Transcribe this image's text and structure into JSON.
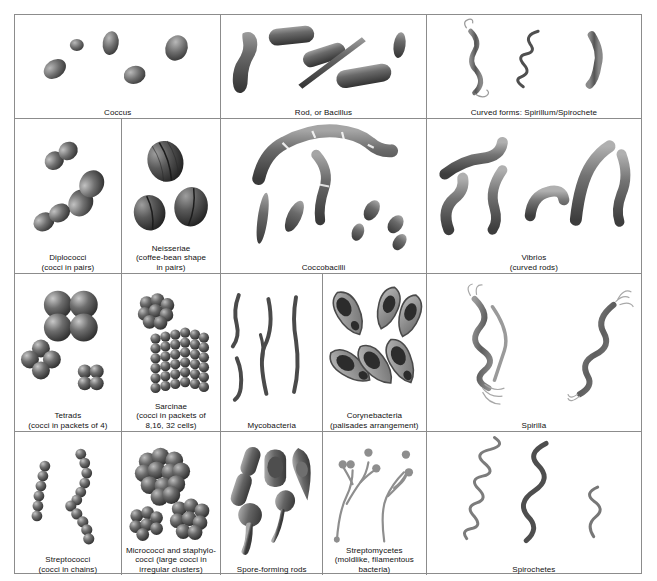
{
  "figure": {
    "kind": "bacterial-morphology-plate",
    "grid_rows": 4,
    "outer_border_color": "#8c8c8c",
    "background": "#ffffff",
    "cell_ink_color": "#4a4a4a"
  },
  "rows": [
    {
      "index": 1,
      "cells": [
        {
          "id": "coccus",
          "label": "Coccus",
          "art": "ovals-scattered",
          "count": 5
        },
        {
          "id": "rod-bacillus",
          "label": "Rod, or Bacillus",
          "art": "rods-scattered",
          "count": 6
        },
        {
          "id": "curved-forms",
          "label": "Curved forms: Spirillum/Spirochete",
          "art": "curved-mixed",
          "count": 3
        }
      ]
    },
    {
      "index": 2,
      "cells": [
        {
          "id": "diplococci",
          "label": "Diplococci\n(cocci in pairs)",
          "art": "cocci-pairs",
          "count": 3
        },
        {
          "id": "neisseriae",
          "label": "Neisseriae\n(coffee-bean shape\nin pairs)",
          "art": "coffee-beans",
          "count": 3
        },
        {
          "id": "coccobacilli",
          "label": "Coccobacilli",
          "art": "coccobacilli",
          "count": 9
        },
        {
          "id": "vibrios",
          "label": "Vibrios\n(curved rods)",
          "art": "curved-rods",
          "count": 6
        }
      ]
    },
    {
      "index": 3,
      "cells": [
        {
          "id": "tetrads",
          "label": "Tetrads\n(cocci in packets of 4)",
          "art": "tetrads",
          "count": 3
        },
        {
          "id": "sarcinae",
          "label": "Sarcinae\n(cocci in packets of\n8,16, 32 cells)",
          "art": "sarcinae",
          "count": 2
        },
        {
          "id": "mycobacteria",
          "label": "Mycobacteria",
          "art": "thin-curved-rods",
          "count": 5
        },
        {
          "id": "corynebacteria",
          "label": "Corynebacteria\n(palisades arrangement)",
          "art": "club-shapes",
          "count": 6
        },
        {
          "id": "spirilla",
          "label": "Spirilla",
          "art": "spirilla",
          "count": 2
        }
      ]
    },
    {
      "index": 4,
      "cells": [
        {
          "id": "streptococci",
          "label": "Streptococci\n(cocci in chains)",
          "art": "chains",
          "count": 3
        },
        {
          "id": "micrococci",
          "label": "Micrococci and staphylo-\ncocci (large cocci in\nirregular clusters)",
          "art": "clusters",
          "count": 3
        },
        {
          "id": "spore-rods",
          "label": "Spore-forming rods",
          "art": "spore-rods",
          "count": 5
        },
        {
          "id": "streptomycetes",
          "label": "Streptomycetes\n(moldlike, filamentous\nbacteria)",
          "art": "filaments",
          "count": 2
        },
        {
          "id": "spirochetes",
          "label": "Spirochetes",
          "art": "spirochetes",
          "count": 3
        }
      ]
    }
  ]
}
